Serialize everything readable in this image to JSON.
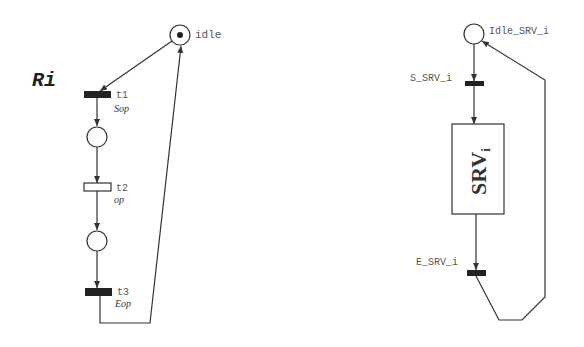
{
  "left_net": {
    "title": "Ri",
    "places": [
      {
        "id": "idle",
        "label": "idle",
        "tokens": 1
      },
      {
        "id": "p1",
        "label": "",
        "tokens": 0
      },
      {
        "id": "p2",
        "label": "",
        "tokens": 0
      }
    ],
    "transitions": [
      {
        "id": "t1",
        "label": "t1",
        "action": "Sop",
        "filled": true
      },
      {
        "id": "t2",
        "label": "t2",
        "action": "op",
        "filled": false
      },
      {
        "id": "t3",
        "label": "t3",
        "action": "Eop",
        "filled": true
      }
    ]
  },
  "right_net": {
    "places": [
      {
        "id": "idle_srv",
        "label": "Idle_SRV_i",
        "tokens": 0
      }
    ],
    "transitions": [
      {
        "id": "s_srv",
        "label": "S_SRV_i",
        "filled": true
      },
      {
        "id": "e_srv",
        "label": "E_SRV_i",
        "filled": true
      }
    ],
    "box": {
      "label": "SRV",
      "subscript": "i"
    }
  },
  "colors": {
    "stroke": "#333333",
    "filled_transition": "#222222",
    "background": "#ffffff"
  }
}
